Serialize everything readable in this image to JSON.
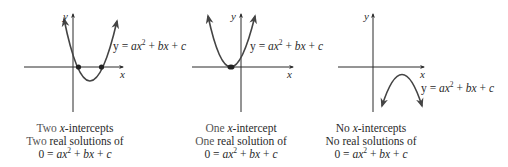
{
  "figure": {
    "panels": [
      {
        "id": "two-intercepts",
        "x_label": "x",
        "y_label": "y",
        "equation": {
          "lhs": "y",
          "eq": "=",
          "a": "a",
          "x": "x",
          "exp": "2",
          "plus1": "+",
          "b": "b",
          "x2": "x",
          "plus2": "+",
          "c": "c"
        },
        "caption": {
          "line1_word": "Two",
          "line1_var": "x",
          "line1_rest": "-intercepts",
          "line2_word": "Two",
          "line2_rest": "real solutions of",
          "line3": {
            "zero": "0",
            "eq": "=",
            "a": "a",
            "x": "x",
            "exp": "2",
            "plus1": "+",
            "b": "b",
            "x2": "x",
            "plus2": "+",
            "c": "c"
          }
        },
        "intercept_count": 2,
        "opens": "up"
      },
      {
        "id": "one-intercept",
        "x_label": "x",
        "y_label": "y",
        "equation": {
          "lhs": "y",
          "eq": "=",
          "a": "a",
          "x": "x",
          "exp": "2",
          "plus1": "+",
          "b": "b",
          "x2": "x",
          "plus2": "+",
          "c": "c"
        },
        "caption": {
          "line1_word": "One",
          "line1_var": "x",
          "line1_rest": "-intercept",
          "line2_word": "One",
          "line2_rest": "real solution of",
          "line3": {
            "zero": "0",
            "eq": "=",
            "a": "a",
            "x": "x",
            "exp": "2",
            "plus1": "+",
            "b": "b",
            "x2": "x",
            "plus2": "+",
            "c": "c"
          }
        },
        "intercept_count": 1,
        "opens": "up"
      },
      {
        "id": "no-intercepts",
        "x_label": "x",
        "y_label": "y",
        "equation": {
          "lhs": "y",
          "eq": "=",
          "a": "a",
          "x": "x",
          "exp": "2",
          "plus1": "+",
          "b": "b",
          "x2": "x",
          "plus2": "+",
          "c": "c"
        },
        "caption": {
          "line1_word": "No",
          "line1_var": "x",
          "line1_rest": "-intercepts",
          "line2_word": "No",
          "line2_rest": "real solutions of",
          "line3": {
            "zero": "0",
            "eq": "=",
            "a": "a",
            "x": "x",
            "exp": "2",
            "plus1": "+",
            "b": "b",
            "x2": "x",
            "plus2": "+",
            "c": "c"
          }
        },
        "intercept_count": 0,
        "opens": "down"
      }
    ]
  }
}
